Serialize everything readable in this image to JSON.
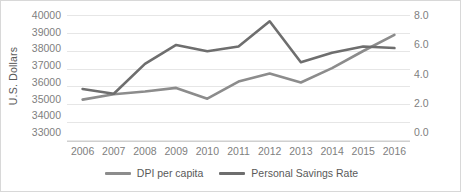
{
  "chart_data": {
    "type": "line",
    "title": "",
    "xlabel": "",
    "ylabel": "U.S. Dollars",
    "ylabel_right": "",
    "grid": true,
    "legend_position": "bottom",
    "categories": [
      "2006",
      "2007",
      "2008",
      "2009",
      "2010",
      "2011",
      "2012",
      "2013",
      "2014",
      "2015",
      "2016"
    ],
    "ylim": [
      33000,
      40000
    ],
    "ylim_right": [
      0.0,
      8.0
    ],
    "yticks": [
      "40000",
      "39000",
      "38000",
      "37000",
      "36000",
      "35000",
      "34000",
      "33000"
    ],
    "yticks_right": [
      "8.0",
      "6.0",
      "4.0",
      "2.0",
      "0.0"
    ],
    "series": [
      {
        "name": "DPI per capita",
        "axis": "left",
        "color": "#8c8c8c",
        "values": [
          35300,
          35600,
          35750,
          35950,
          35350,
          36300,
          36750,
          36250,
          37050,
          38000,
          38900
        ]
      },
      {
        "name": "Personal Savings Rate",
        "axis": "right",
        "color": "#6e6e6e",
        "values": [
          3.3,
          3.0,
          4.9,
          6.1,
          5.7,
          6.0,
          7.6,
          5.0,
          5.6,
          6.0,
          5.9
        ]
      }
    ]
  }
}
